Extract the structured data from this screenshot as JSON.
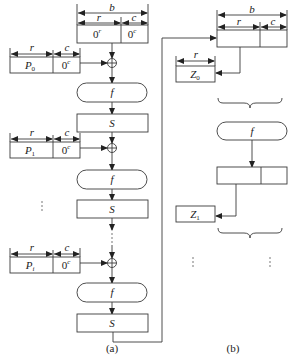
{
  "diagram": {
    "panel_a": {
      "caption": "(a)",
      "state_init": {
        "width_label": "b",
        "rate_label": "r",
        "cap_label": "c",
        "rate_value": "0",
        "rate_sup": "r",
        "cap_value": "0",
        "cap_sup": "c"
      },
      "blocks": [
        {
          "p_label": "P",
          "p_sub": "0",
          "r_label": "r",
          "c_label": "c",
          "pad": "0",
          "pad_sup": "c"
        },
        {
          "p_label": "P",
          "p_sub": "1",
          "r_label": "r",
          "c_label": "c",
          "pad": "0",
          "pad_sup": "c"
        },
        {
          "p_label": "P",
          "p_sub": "i",
          "r_label": "r",
          "c_label": "c",
          "pad": "0",
          "pad_sup": "c"
        }
      ],
      "f_label": "f",
      "s_label": "S",
      "ellipsis": "⋮"
    },
    "panel_b": {
      "caption": "(b)",
      "state": {
        "width_label": "b",
        "rate_label": "r",
        "cap_label": "c"
      },
      "outputs": [
        {
          "label": "Z",
          "sub": "0",
          "r_label": "r"
        },
        {
          "label": "Z",
          "sub": "1"
        }
      ],
      "f_label": "f",
      "ellipsis": "⋮"
    }
  }
}
